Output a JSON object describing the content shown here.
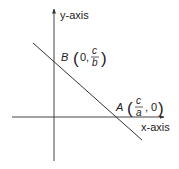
{
  "diagram": {
    "axes": {
      "x_label": "x-axis",
      "y_label": "y-axis"
    },
    "line": {
      "description": "straight line ax + by = c crossing both axes"
    },
    "points": {
      "B": {
        "name": "B",
        "open": "(",
        "x": "0,",
        "y_num": "c",
        "y_den": "b",
        "close": ")"
      },
      "A": {
        "name": "A",
        "open": "(",
        "x_num": "c",
        "x_den": "a",
        "y": ", 0",
        "close": ")"
      }
    },
    "colors": {
      "stroke": "#333333",
      "text": "#222222"
    }
  }
}
